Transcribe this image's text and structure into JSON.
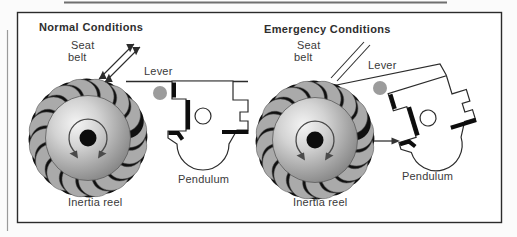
{
  "figure": {
    "type": "seat-belt inertia reel mechanism diagram",
    "colors": {
      "background": "#ffffff",
      "frame_line": "#2b2b2b",
      "tooth_gray": "#a9a9a9",
      "shadow_black": "#101010",
      "pivot_dot_gray": "#9c9c9c",
      "text": "#3a3a3a"
    },
    "panels": [
      {
        "title": "Normal Conditions",
        "labels": {
          "seat_line1": "Seat",
          "seat_line2": "belt",
          "lever": "Lever",
          "pendulum": "Pendulum",
          "inertia_reel": "Inertia reel"
        }
      },
      {
        "title": "Emergency Conditions",
        "labels": {
          "seat_line1": "Seat",
          "seat_line2": "belt",
          "lever": "Lever",
          "pendulum": "Pendulum",
          "inertia_reel": "Inertia reel"
        }
      }
    ]
  }
}
